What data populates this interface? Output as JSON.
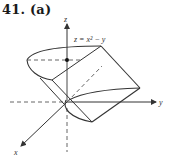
{
  "title": "41. (a)",
  "figure": {
    "surface_label": "z = x² − y",
    "axes": {
      "x": "x",
      "y": "y",
      "z": "z"
    },
    "colors": {
      "stroke": "#333333",
      "background": "#ffffff"
    }
  }
}
